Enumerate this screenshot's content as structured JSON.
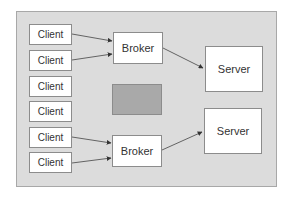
{
  "diagram": {
    "colors": {
      "panel_fill": "#dcdcdc",
      "panel_border": "#a8a8a8",
      "node_fill": "#ffffff",
      "node_border": "#8c8c8c",
      "gray_block": "#a9a9a9",
      "arrow": "#333333",
      "text": "#333333"
    },
    "clients": [
      {
        "label": "Client"
      },
      {
        "label": "Client"
      },
      {
        "label": "Client"
      },
      {
        "label": "Client"
      },
      {
        "label": "Client"
      },
      {
        "label": "Client"
      }
    ],
    "brokers": [
      {
        "label": "Broker"
      },
      {
        "label": "Broker"
      }
    ],
    "servers": [
      {
        "label": "Server"
      },
      {
        "label": "Server"
      }
    ],
    "edges": [
      {
        "from": "client-1",
        "to": "broker-1"
      },
      {
        "from": "client-2",
        "to": "broker-1"
      },
      {
        "from": "broker-1",
        "to": "server-1"
      },
      {
        "from": "client-5",
        "to": "broker-2"
      },
      {
        "from": "client-6",
        "to": "broker-2"
      },
      {
        "from": "broker-2",
        "to": "server-2"
      }
    ]
  }
}
